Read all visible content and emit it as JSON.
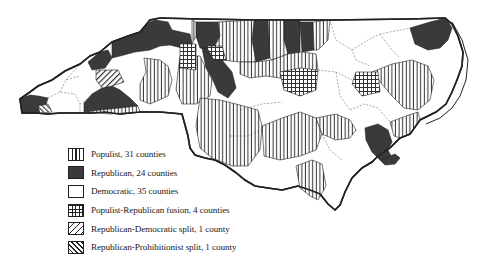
{
  "map": {
    "subject": "North Carolina counties by party",
    "county_labels_visible": [
      "Alleghany",
      "Rockingham",
      "Guilford",
      "Randolph",
      "Moore",
      "Halifax",
      "Northampton",
      "Hertford",
      "Gates",
      "Bertie",
      "Martin",
      "Pitt",
      "Beaufort",
      "Franklin",
      "Johnston",
      "Wayne",
      "Sampson",
      "Duplin",
      "Onslow",
      "Pender",
      "Bladen",
      "Robeson",
      "Columbus",
      "Brunswick"
    ],
    "colors": {
      "border": "#222222",
      "republican_fill": "#3a3a3a",
      "democratic_fill": "#ffffff",
      "hatch": "#222222"
    }
  },
  "legend": {
    "items": [
      {
        "pattern": "populist",
        "label": "Populist, 31 counties"
      },
      {
        "pattern": "republican",
        "label": "Republican, 24 counties"
      },
      {
        "pattern": "democratic",
        "label": "Democratic, 35 counties"
      },
      {
        "pattern": "fusion",
        "label": "Populist-Republican fusion, 4 counties"
      },
      {
        "pattern": "repdem",
        "label": "Republican-Democratic split, 1 county"
      },
      {
        "pattern": "repproh",
        "label": "Republican-Prohibitionist split, 1 county"
      }
    ]
  }
}
